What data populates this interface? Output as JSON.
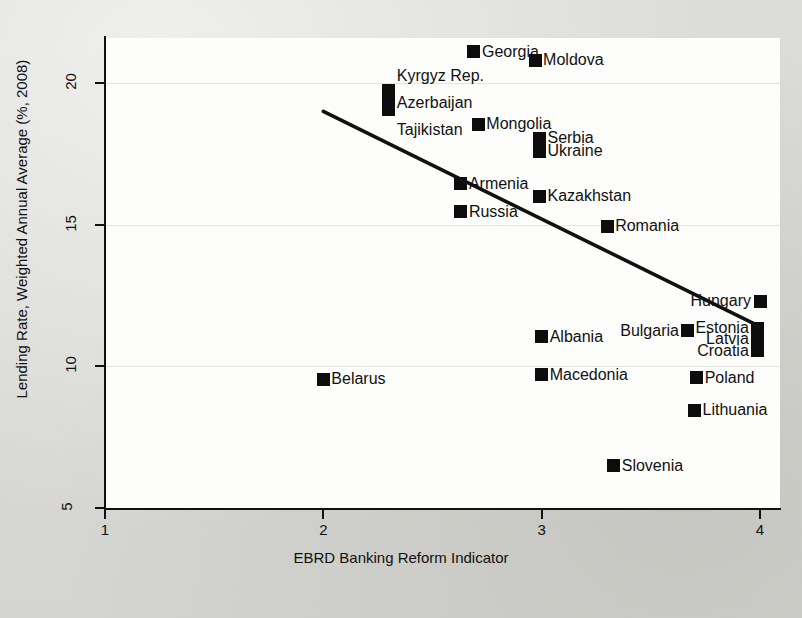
{
  "chart_data": {
    "type": "scatter",
    "title": "",
    "xlabel": "EBRD Banking Reform Indicator",
    "ylabel": "Lending Rate, Weighted Annual Average (%, 2008)",
    "xlim": [
      0.8,
      4.1
    ],
    "ylim": [
      4.6,
      21.8
    ],
    "xticks": [
      1,
      2,
      3,
      4
    ],
    "xtick_labels": [
      "1",
      "2",
      "3",
      "4"
    ],
    "yticks": [
      5,
      10,
      15,
      20
    ],
    "ytick_labels": [
      "5",
      "10",
      "15",
      "20"
    ],
    "grid": "horizontal",
    "legend": "none",
    "marker": "filled-square",
    "marker_color": "#0d0d0d",
    "points": [
      {
        "label": "Georgia",
        "x": 2.69,
        "y": 21.1,
        "label_side": "right"
      },
      {
        "label": "Moldova",
        "x": 2.97,
        "y": 20.8,
        "label_side": "right"
      },
      {
        "label": "Kyrgyz Rep.",
        "x": 2.3,
        "y": 19.75,
        "label_side": "right-stack-0"
      },
      {
        "label": "Azerbaijan",
        "x": 2.3,
        "y": 19.4,
        "label_side": "right-stack-1"
      },
      {
        "label": "Tajikistan",
        "x": 2.3,
        "y": 19.05,
        "label_side": "right-stack-2"
      },
      {
        "label": "Mongolia",
        "x": 2.71,
        "y": 18.55,
        "label_side": "right"
      },
      {
        "label": "Serbia",
        "x": 2.99,
        "y": 18.05,
        "label_side": "right"
      },
      {
        "label": "Ukraine",
        "x": 2.99,
        "y": 17.6,
        "label_side": "right"
      },
      {
        "label": "Armenia",
        "x": 2.63,
        "y": 16.45,
        "label_side": "right"
      },
      {
        "label": "Kazakhstan",
        "x": 2.99,
        "y": 16.0,
        "label_side": "right"
      },
      {
        "label": "Russia",
        "x": 2.63,
        "y": 15.45,
        "label_side": "right"
      },
      {
        "label": "Romania",
        "x": 3.3,
        "y": 14.95,
        "label_side": "right"
      },
      {
        "label": "Hungary",
        "x": 4.0,
        "y": 12.3,
        "label_side": "left"
      },
      {
        "label": "Estonia",
        "x": 3.99,
        "y": 11.35,
        "label_side": "left"
      },
      {
        "label": "Bulgaria",
        "x": 3.67,
        "y": 11.25,
        "label_side": "left"
      },
      {
        "label": "Latvia",
        "x": 3.99,
        "y": 10.95,
        "label_side": "left"
      },
      {
        "label": "Albania",
        "x": 3.0,
        "y": 11.05,
        "label_side": "right"
      },
      {
        "label": "Croatia",
        "x": 3.99,
        "y": 10.55,
        "label_side": "left"
      },
      {
        "label": "Belarus",
        "x": 2.0,
        "y": 9.55,
        "label_side": "right"
      },
      {
        "label": "Macedonia",
        "x": 3.0,
        "y": 9.7,
        "label_side": "right"
      },
      {
        "label": "Poland",
        "x": 3.71,
        "y": 9.6,
        "label_side": "right"
      },
      {
        "label": "Lithuania",
        "x": 3.7,
        "y": 8.45,
        "label_side": "right"
      },
      {
        "label": "Slovenia",
        "x": 3.33,
        "y": 6.5,
        "label_side": "right"
      }
    ],
    "trendline": {
      "type": "linear-fit",
      "x0": 2.0,
      "y0": 19.0,
      "x1": 4.0,
      "y1": 11.4,
      "slope": -3.8,
      "color": "#111111"
    }
  }
}
